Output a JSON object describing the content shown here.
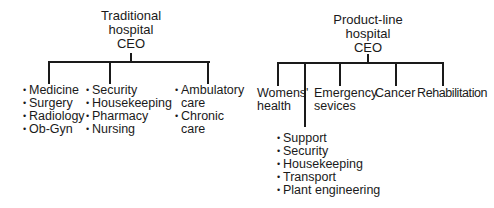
{
  "left_chart": {
    "title": "Traditional\nhospital\nCEO",
    "groups": [
      {
        "items": [
          "Medicine",
          "Surgery",
          "Radiology",
          "Ob-Gyn"
        ]
      },
      {
        "items": [
          "Security",
          "Housekeeping",
          "Pharmacy",
          "Nursing"
        ]
      },
      {
        "items": [
          "Ambulatory\ncare",
          "Chronic\ncare"
        ]
      }
    ]
  },
  "right_chart": {
    "title": "Product-line\nhospital\nCEO",
    "product_lines": [
      "Womens'\nhealth",
      "Emergency\nsevices",
      "Cancer",
      "Rehabilitation"
    ],
    "support_group": {
      "items": [
        "Support",
        "Security",
        "Housekeeping",
        "Transport",
        "Plant engineering"
      ]
    }
  },
  "bullet": "•"
}
